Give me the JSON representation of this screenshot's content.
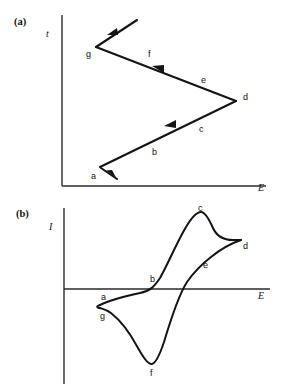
{
  "figure": {
    "background_color": "#ffffff",
    "ink_color": "#141414",
    "panels": [
      {
        "id": "panel-a",
        "label": "(a)",
        "label_pos": {
          "x": 14,
          "y": 25
        },
        "y_axis_label": "t",
        "y_axis_label_pos": {
          "x": 46,
          "y": 37
        },
        "x_axis_label": "E",
        "x_axis_label_pos": {
          "x": 258,
          "y": 191
        },
        "axes": {
          "y_axis": {
            "x": 62,
            "y_top": 15,
            "y_bottom": 186
          },
          "x_axis": {
            "y": 186,
            "x_left": 62,
            "x_right": 266
          }
        },
        "waveform": {
          "type": "triangular-potential-sweep",
          "vertices": [
            {
              "label": "a",
              "x": 100,
              "y": 167,
              "label_x": 91,
              "label_y": 179
            },
            {
              "label": "d",
              "x": 236,
              "y": 101,
              "label_x": 243,
              "label_y": 100
            },
            {
              "label": "g",
              "x": 96,
              "y": 47,
              "label_x": 86,
              "label_y": 57
            }
          ],
          "segment_labels": [
            {
              "label": "b",
              "x": 152,
              "y": 155
            },
            {
              "label": "c",
              "x": 199,
              "y": 132
            },
            {
              "label": "e",
              "x": 201,
              "y": 83
            },
            {
              "label": "f",
              "x": 148,
              "y": 57
            }
          ],
          "start_tail": {
            "x1": 115,
            "y1": 178,
            "x2": 100,
            "y2": 167
          },
          "end_tail": {
            "x1": 96,
            "y1": 47,
            "x2": 136,
            "y2": 20
          }
        }
      },
      {
        "id": "panel-b",
        "label": "(b)",
        "label_pos": {
          "x": 16,
          "y": 217
        },
        "y_axis_label": "I",
        "y_axis_label_pos": {
          "x": 49,
          "y": 230
        },
        "x_axis_label": "E",
        "x_axis_label_pos": {
          "x": 258,
          "y": 299
        },
        "axes": {
          "y_axis": {
            "x": 64,
            "y_top": 208,
            "y_bottom": 384
          },
          "x_axis": {
            "y": 289,
            "x_left": 64,
            "x_right": 270
          }
        },
        "voltammogram": {
          "type": "cyclic-voltammogram",
          "zero_current_line_y": 289,
          "point_labels": [
            {
              "label": "a",
              "x": 101,
              "y": 300,
              "curve_x": 103,
              "curve_y": 303
            },
            {
              "label": "b",
              "x": 150,
              "y": 282,
              "curve_x": 156,
              "curve_y": 290
            },
            {
              "label": "c",
              "x": 200,
              "y": 211,
              "curve_x": 201,
              "curve_y": 214
            },
            {
              "label": "d",
              "x": 243,
              "y": 247,
              "curve_x": 240,
              "curve_y": 240
            },
            {
              "label": "e",
              "x": 203,
              "y": 268,
              "curve_x": 197,
              "curve_y": 267
            },
            {
              "label": "f",
              "x": 152,
              "y": 375,
              "curve_x": 152,
              "curve_y": 364
            },
            {
              "label": "g",
              "x": 101,
              "y": 318,
              "curve_x": 104,
              "curve_y": 312
            }
          ]
        }
      }
    ]
  }
}
